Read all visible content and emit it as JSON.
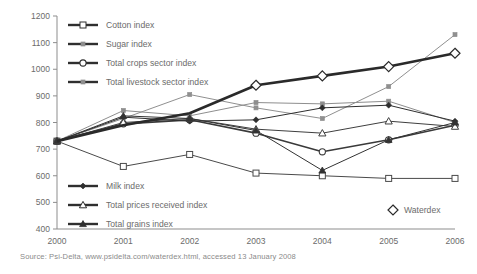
{
  "source_note": "Source: Psi-Delta, www.psidelta.com/waterdex.html, accessed 13 January 2008",
  "legend_top": [
    {
      "label": "Cotton index",
      "marker": "open-square",
      "icon": "line-marker-icon"
    },
    {
      "label": "Sugar index",
      "marker": "small-filled-square",
      "icon": "line-marker-icon"
    },
    {
      "label": "Total crops sector index",
      "marker": "open-circle",
      "icon": "line-marker-icon"
    },
    {
      "label": "Total livestock sector index",
      "marker": "small-filled-square-grey",
      "icon": "line-marker-icon"
    }
  ],
  "legend_bottom": [
    {
      "label": "Milk index",
      "marker": "small-filled-diamond",
      "icon": "line-marker-icon"
    },
    {
      "label": "Total prices received index",
      "marker": "open-triangle",
      "icon": "line-marker-icon"
    },
    {
      "label": "Total grains index",
      "marker": "filled-triangle",
      "icon": "line-marker-icon"
    }
  ],
  "legend_waterdex": {
    "label": "Waterdex",
    "marker": "open-diamond",
    "icon": "diamond-marker-icon"
  },
  "chart_data": {
    "type": "line",
    "title": "",
    "xlabel": "",
    "ylabel": "",
    "x": [
      2000,
      2001,
      2002,
      2003,
      2004,
      2005,
      2006
    ],
    "xtick_labels": [
      "2000",
      "2001",
      "2002",
      "2003",
      "2004",
      "2005",
      "2006"
    ],
    "ytick_labels": [
      "400",
      "500",
      "600",
      "700",
      "800",
      "900",
      "1000",
      "1100",
      "1200"
    ],
    "yticks": [
      400,
      500,
      600,
      700,
      800,
      900,
      1000,
      1100,
      1200
    ],
    "ylim": [
      400,
      1200
    ],
    "grid": false,
    "legend_position": "inside-top-left and inside-bottom-left",
    "series": [
      {
        "name": "Cotton index",
        "marker": "open-square",
        "color": "#4a4a4a",
        "width": 1.0,
        "values": [
          730,
          635,
          680,
          610,
          600,
          590,
          590
        ]
      },
      {
        "name": "Sugar index",
        "marker": "small-filled-square",
        "color": "#909090",
        "width": 1.0,
        "values": [
          730,
          815,
          905,
          855,
          815,
          935,
          1130
        ]
      },
      {
        "name": "Total crops sector index",
        "marker": "open-circle",
        "color": "#3a3a3a",
        "width": 1.6,
        "values": [
          730,
          795,
          810,
          760,
          690,
          735,
          790
        ]
      },
      {
        "name": "Total livestock sector index",
        "marker": "small-filled-square-grey",
        "color": "#8e8e8e",
        "width": 1.0,
        "values": [
          730,
          845,
          825,
          875,
          870,
          880,
          800
        ]
      },
      {
        "name": "Milk index",
        "marker": "small-filled-diamond",
        "color": "#2f2f2f",
        "width": 1.0,
        "values": [
          730,
          820,
          805,
          810,
          855,
          865,
          805
        ]
      },
      {
        "name": "Total prices received index",
        "marker": "open-triangle",
        "color": "#3f3f3f",
        "width": 1.0,
        "values": [
          730,
          800,
          815,
          775,
          760,
          805,
          785
        ]
      },
      {
        "name": "Total grains index",
        "marker": "filled-triangle",
        "color": "#333333",
        "width": 1.0,
        "values": [
          730,
          825,
          815,
          770,
          620,
          735,
          800
        ]
      },
      {
        "name": "Waterdex",
        "marker": "open-diamond",
        "color": "#2a2a2a",
        "width": 2.6,
        "values": [
          730,
          790,
          835,
          940,
          975,
          1010,
          1060
        ]
      }
    ]
  }
}
